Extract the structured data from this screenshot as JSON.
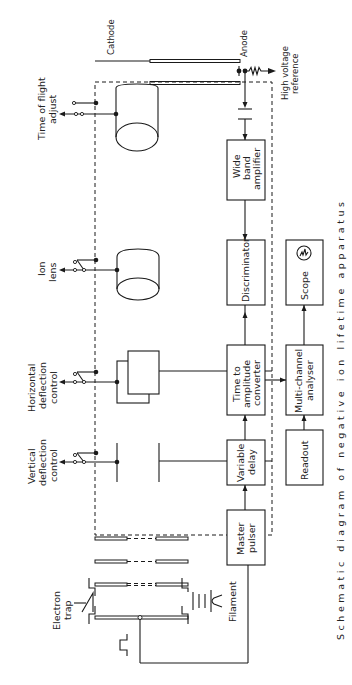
{
  "diagram": {
    "orientation": "rotated 90deg counter-clockwise",
    "caption": "Schematic diagram of negative ion lifetime apparatus",
    "labels": {
      "cathode": "Cathode",
      "anode": "Anode",
      "high_voltage_reference": [
        "High voltage",
        "reference"
      ],
      "time_of_flight_adjust": [
        "Time of flight",
        "adjust"
      ],
      "ion_lens": [
        "Ion",
        "lens"
      ],
      "horizontal_deflection_control": [
        "Horizontal",
        "deflection",
        "control"
      ],
      "vertical_deflection_control": [
        "Vertical",
        "deflection",
        "control"
      ],
      "electron_trap": [
        "Electron",
        "trap"
      ],
      "filament": "Filament"
    },
    "blocks": {
      "wide_band_amplifier": [
        "Wide",
        "band",
        "amplifier"
      ],
      "discriminator": [
        "Discriminator"
      ],
      "time_to_amplitude_converter": [
        "Time  to",
        "amplitude",
        "converter"
      ],
      "variable_delay": [
        "Variable",
        "delay"
      ],
      "master_pulser": [
        "Master",
        "pulser"
      ],
      "scope": [
        "Scope"
      ],
      "multi_channel_analyser": [
        "Multi-channel",
        "analyser"
      ],
      "readout": [
        "Readout"
      ]
    },
    "connections": [
      {
        "from": "Master pulser",
        "to": "Variable delay"
      },
      {
        "from": "Variable delay",
        "to": "Time to amplitude converter"
      },
      {
        "from": "Anode",
        "to": "Wide band amplifier"
      },
      {
        "from": "Wide band amplifier",
        "to": "Discriminator"
      },
      {
        "from": "Discriminator",
        "to": "Time to amplitude converter"
      },
      {
        "from": "Time to amplitude converter",
        "to": "Multi-channel analyser"
      },
      {
        "from": "Multi-channel analyser",
        "to": "Scope"
      },
      {
        "from": "Multi-channel analyser",
        "to": "Readout"
      },
      {
        "from": "Master pulser",
        "to": "Electron gun grid"
      }
    ]
  }
}
